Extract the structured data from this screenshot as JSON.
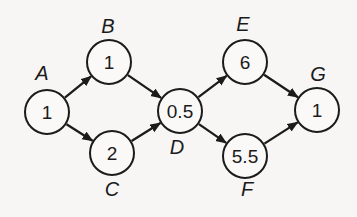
{
  "diagram": {
    "background_color": "#f7f6f4",
    "stroke_color": "#1b1b1b",
    "node_fill_color": "#faf9f7",
    "node_radius": 22,
    "nodes": [
      {
        "id": "A",
        "label": "A",
        "value": "1",
        "x": 47,
        "y": 112,
        "label_x": 42,
        "label_y": 80
      },
      {
        "id": "B",
        "label": "B",
        "value": "1",
        "x": 109,
        "y": 62,
        "label_x": 108,
        "label_y": 33
      },
      {
        "id": "C",
        "label": "C",
        "value": "2",
        "x": 112,
        "y": 153,
        "label_x": 112,
        "label_y": 196
      },
      {
        "id": "D",
        "label": "D",
        "value": "0.5",
        "x": 180,
        "y": 111,
        "label_x": 177,
        "label_y": 154
      },
      {
        "id": "E",
        "label": "E",
        "value": "6",
        "x": 245,
        "y": 62,
        "label_x": 243,
        "label_y": 31
      },
      {
        "id": "F",
        "label": "F",
        "value": "5.5",
        "x": 245,
        "y": 156,
        "label_x": 247,
        "label_y": 196
      },
      {
        "id": "G",
        "label": "G",
        "value": "1",
        "x": 317,
        "y": 110,
        "label_x": 318,
        "label_y": 81
      }
    ],
    "edges": [
      {
        "from": "A",
        "to": "B"
      },
      {
        "from": "A",
        "to": "C"
      },
      {
        "from": "B",
        "to": "D"
      },
      {
        "from": "C",
        "to": "D"
      },
      {
        "from": "D",
        "to": "E"
      },
      {
        "from": "D",
        "to": "F"
      },
      {
        "from": "E",
        "to": "G"
      },
      {
        "from": "F",
        "to": "G"
      }
    ]
  }
}
